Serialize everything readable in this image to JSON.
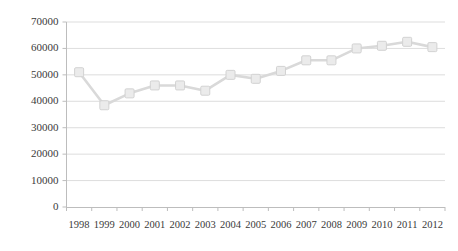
{
  "chart_data": {
    "type": "line",
    "title": "",
    "subtitle": "",
    "xlabel": "",
    "ylabel": "",
    "categories": [
      "1998",
      "1999",
      "2000",
      "2001",
      "2002",
      "2003",
      "2004",
      "2005",
      "2006",
      "2007",
      "2008",
      "2009",
      "2010",
      "2011",
      "2012"
    ],
    "series": [
      {
        "name": "Series 1",
        "values": [
          51000,
          38500,
          43000,
          46000,
          46000,
          44000,
          50000,
          48500,
          51500,
          55500,
          55500,
          60000,
          61000,
          62500,
          60500
        ]
      }
    ],
    "ylim": [
      0,
      70000
    ],
    "y_ticks": [
      0,
      10000,
      20000,
      30000,
      40000,
      50000,
      60000,
      70000
    ],
    "y_tick_labels": [
      "0",
      "10000",
      "20000",
      "30000",
      "40000",
      "50000",
      "60000",
      "70000"
    ],
    "grid": true,
    "grid_axis": "y",
    "legend": false,
    "legend_position": "none",
    "annotations": [],
    "marker": "square",
    "colors": {
      "line": "#d9d9d9",
      "marker_fill": "#ebebeb",
      "marker_stroke": "#d2d2d2",
      "gridline": "#d4d4d4",
      "axis": "#bdbdbd",
      "tick_text": "#3a3a3a",
      "background": "#ffffff"
    }
  }
}
